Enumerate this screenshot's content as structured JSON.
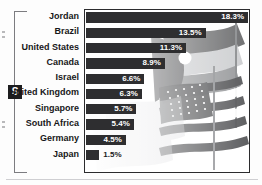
{
  "badge": {
    "label": "S"
  },
  "chart_data": {
    "type": "bar",
    "orientation": "horizontal",
    "title": "",
    "xlabel": "",
    "ylabel": "",
    "grid": false,
    "legend": null,
    "xlim": [
      0,
      18.3
    ],
    "categories": [
      "Jordan",
      "Brazil",
      "United States",
      "Canada",
      "Israel",
      "United Kingdom",
      "Singapore",
      "South Africa",
      "Germany",
      "Japan"
    ],
    "values": [
      18.3,
      13.5,
      11.3,
      8.9,
      6.6,
      6.3,
      5.7,
      5.4,
      4.5,
      1.5
    ],
    "value_labels": [
      "18.3%",
      "13.5%",
      "11.3%",
      "8.9%",
      "6.6%",
      "6.3%",
      "5.7%",
      "5.4%",
      "4.5%",
      "1.5%"
    ],
    "label_placement": [
      "inside",
      "inside",
      "inside",
      "inside",
      "inside",
      "inside",
      "inside",
      "inside",
      "inside",
      "outside"
    ],
    "bar_color": "#2e2e30",
    "label_color": "#171719",
    "background": "#ffffff"
  },
  "decoration": {
    "background_image": "flags-photo"
  }
}
